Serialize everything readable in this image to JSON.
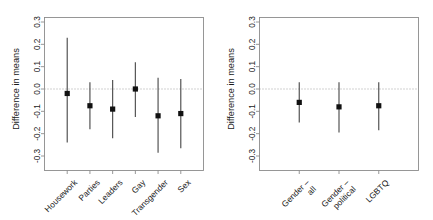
{
  "figure": {
    "width": 433,
    "height": 220,
    "background": "#ffffff",
    "line_color": "#8c8c8c",
    "bar_color": "#4d4d4d",
    "point_color": "#111111",
    "zero_line_color": "#9a9a9a"
  },
  "chart_data": [
    {
      "type": "scatter",
      "panel": "left",
      "title": "",
      "xlabel": "",
      "ylabel": "Difference in means",
      "ylim": [
        -0.3,
        0.3
      ],
      "yticks": [
        0.3,
        0.2,
        0.1,
        0.0,
        -0.1,
        -0.2,
        -0.3
      ],
      "ytick_labels": [
        "0.3",
        "0.2",
        "0.1",
        "0.0",
        "-0.1",
        "-0.2",
        "-0.3"
      ],
      "grid": false,
      "legend": "none",
      "reference_line": 0.0,
      "categories": [
        "Housework",
        "Parties",
        "Leaders",
        "Gay",
        "Transgender",
        "Sex"
      ],
      "values": [
        -0.02,
        -0.075,
        -0.09,
        0.0,
        -0.12,
        -0.11
      ],
      "ci_low": [
        -0.24,
        -0.18,
        -0.22,
        -0.125,
        -0.285,
        -0.265
      ],
      "ci_high": [
        0.23,
        0.03,
        0.04,
        0.12,
        0.05,
        0.045
      ]
    },
    {
      "type": "scatter",
      "panel": "right",
      "title": "",
      "xlabel": "",
      "ylabel": "Difference in means",
      "ylim": [
        -0.3,
        0.3
      ],
      "yticks": [
        0.3,
        0.2,
        0.1,
        0.0,
        -0.1,
        -0.2,
        -0.3
      ],
      "ytick_labels": [
        "0.3",
        "0.2",
        "0.1",
        "0.0",
        "-0.1",
        "-0.2",
        "-0.3"
      ],
      "grid": false,
      "legend": "none",
      "reference_line": 0.0,
      "categories": [
        "Gender –\nall",
        "Gender –\npolitical",
        "LGBTQ"
      ],
      "category_lines": [
        [
          "Gender –",
          "all"
        ],
        [
          "Gender –",
          "political"
        ],
        [
          "LGBTQ"
        ]
      ],
      "values": [
        -0.06,
        -0.08,
        -0.075
      ],
      "ci_low": [
        -0.15,
        -0.195,
        -0.185
      ],
      "ci_high": [
        0.03,
        0.03,
        0.03
      ]
    }
  ]
}
